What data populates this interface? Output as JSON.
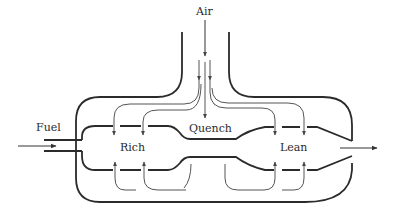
{
  "diagram": {
    "labels": {
      "air": "Air",
      "fuel": "Fuel",
      "rich": "Rich",
      "quench": "Quench",
      "lean": "Lean"
    },
    "zones": [
      "Rich",
      "Quench",
      "Lean"
    ],
    "inputs": [
      "Air",
      "Fuel"
    ],
    "colors": {
      "stroke": "#2b2b2b",
      "flow": "#555555",
      "background": "#ffffff"
    }
  }
}
